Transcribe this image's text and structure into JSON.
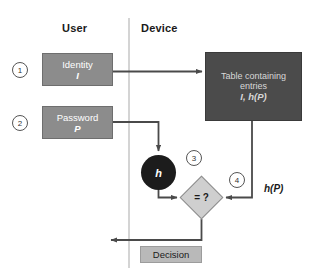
{
  "diagram": {
    "columns": [
      {
        "id": "user",
        "label": "User"
      },
      {
        "id": "device",
        "label": "Device"
      }
    ],
    "divider": {
      "name": "user-device-divider",
      "x": 129
    },
    "nodes": [
      {
        "id": "identity",
        "type": "process",
        "line1": "Identity",
        "line2": "I",
        "fill": "#8c8c8c",
        "text_color": "#ffffff"
      },
      {
        "id": "password",
        "type": "process",
        "line1": "Password",
        "line2": "P",
        "fill": "#8c8c8c",
        "text_color": "#ffffff"
      },
      {
        "id": "table",
        "type": "store",
        "line1": "Table containing",
        "line2": "entries",
        "line3": "I, h(P)",
        "fill": "#4b4b4b",
        "text_color": "#d8d8d8"
      },
      {
        "id": "hash",
        "type": "circle",
        "label": "h",
        "fill": "#1c1c1c",
        "text_color": "#ffffff"
      },
      {
        "id": "compare",
        "type": "decision",
        "label": "= ?",
        "fill": "#cfcfcf",
        "text_color": "#1a1a1a"
      },
      {
        "id": "decision",
        "type": "output",
        "label": "Decision",
        "fill": "#b9b9b9",
        "text_color": "#1a1a1a"
      }
    ],
    "step_markers": [
      {
        "id": "step-1",
        "label": "1"
      },
      {
        "id": "step-2",
        "label": "2"
      },
      {
        "id": "step-3",
        "label": "3"
      },
      {
        "id": "step-4",
        "label": "4"
      }
    ],
    "edge_labels": [
      {
        "id": "hp",
        "label": "h(P)"
      }
    ],
    "edges": [
      {
        "from": "identity",
        "to": "table",
        "name": "identity-to-table-arrow"
      },
      {
        "from": "password",
        "to": "hash",
        "name": "password-to-hash-arrow"
      },
      {
        "from": "hash",
        "to": "compare",
        "name": "hash-to-compare-arrow"
      },
      {
        "from": "table",
        "to": "compare",
        "name": "table-to-compare-arrow"
      },
      {
        "from": "compare",
        "to": "decision",
        "name": "compare-to-decision-arrow"
      }
    ],
    "colors": {
      "stroke": "#4a4a4a",
      "divider": "#c2c2c2",
      "background": "#ffffff"
    }
  }
}
